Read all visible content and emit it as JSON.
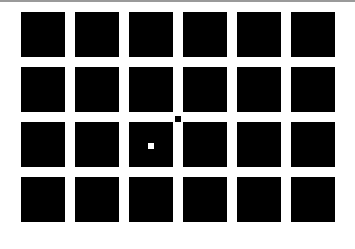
{
  "grid": {
    "rows": 4,
    "columns": 6,
    "cell_color": "#000000",
    "background_color": "#ffffff"
  },
  "markers": [
    {
      "name": "white-dot",
      "color": "#ffffff",
      "x": 148,
      "y": 143,
      "size": 6
    },
    {
      "name": "black-dot",
      "color": "#000000",
      "x": 175,
      "y": 116,
      "size": 6
    }
  ]
}
